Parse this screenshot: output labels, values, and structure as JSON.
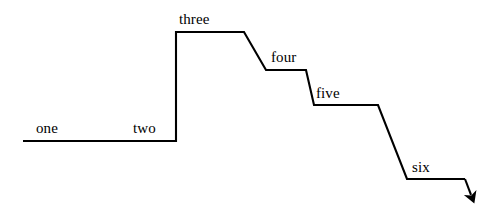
{
  "figure": {
    "title": "",
    "background_color": "#ffffff",
    "line_color": "#000000",
    "text_color": "#000000",
    "line_width": 2,
    "width": 502,
    "height": 216
  },
  "chart_data": {
    "type": "line",
    "title": "",
    "xlabel": "",
    "ylabel": "",
    "grid": false,
    "legend_position": "none",
    "axis_ranges": {
      "xlim": [
        0,
        502
      ],
      "ylim": [
        216,
        0
      ]
    },
    "categories": [
      "one",
      "two",
      "three",
      "four",
      "five",
      "six"
    ],
    "values": [
      141,
      141,
      32,
      70,
      105,
      179
    ],
    "series": [
      {
        "name": "step-path",
        "points": [
          {
            "x": 23,
            "y": 141
          },
          {
            "x": 176,
            "y": 141
          },
          {
            "x": 176,
            "y": 32
          },
          {
            "x": 244,
            "y": 32
          },
          {
            "x": 266,
            "y": 70
          },
          {
            "x": 306,
            "y": 70
          },
          {
            "x": 314,
            "y": 105
          },
          {
            "x": 378,
            "y": 105
          },
          {
            "x": 407,
            "y": 179
          },
          {
            "x": 465,
            "y": 179
          },
          {
            "x": 473,
            "y": 200
          }
        ]
      }
    ],
    "annotations": [
      {
        "text": "one",
        "x": 36,
        "y": 136,
        "attached_segment": "baseline-left"
      },
      {
        "text": "two",
        "x": 133,
        "y": 136,
        "attached_segment": "baseline-right"
      },
      {
        "text": "three",
        "x": 179,
        "y": 27,
        "attached_segment": "plateau-three"
      },
      {
        "text": "four",
        "x": 271,
        "y": 65,
        "attached_segment": "plateau-four"
      },
      {
        "text": "five",
        "x": 316,
        "y": 101,
        "attached_segment": "plateau-five"
      },
      {
        "text": "six",
        "x": 412,
        "y": 175,
        "attached_segment": "plateau-six"
      }
    ],
    "arrowhead": {
      "at_x": 473,
      "at_y": 200,
      "direction": "down-right"
    }
  },
  "labels": {
    "one": "one",
    "two": "two",
    "three": "three",
    "four": "four",
    "five": "five",
    "six": "six"
  }
}
